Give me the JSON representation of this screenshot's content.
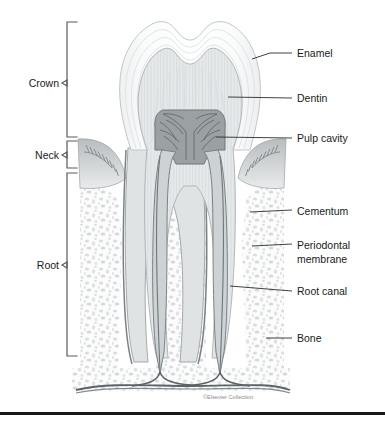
{
  "figure": {
    "background_color": "#ffffff",
    "credit": "©Elsevier Collection"
  },
  "region_labels": [
    {
      "id": "crown",
      "label": "Crown",
      "text_x": 60,
      "text_y": 85,
      "bracket_top": 22,
      "bracket_bottom": 137,
      "bracket_x": 67,
      "tick_x": 77
    },
    {
      "id": "neck",
      "label": "Neck",
      "text_x": 60,
      "text_y": 158,
      "bracket_top": 141,
      "bracket_bottom": 168,
      "bracket_x": 67,
      "tick_x": 77
    },
    {
      "id": "root",
      "label": "Root",
      "text_x": 60,
      "text_y": 267,
      "bracket_top": 173,
      "bracket_bottom": 356,
      "bracket_x": 67,
      "tick_x": 77
    }
  ],
  "part_labels": [
    {
      "id": "enamel",
      "label": "Enamel",
      "text_x": 298,
      "text_y": 55,
      "leader_from_x": 252,
      "leader_from_y": 58,
      "leader_to_x": 292,
      "leader_to_y": 52
    },
    {
      "id": "dentin",
      "label": "Dentin",
      "text_x": 298,
      "text_y": 101,
      "leader_from_x": 228,
      "leader_from_y": 97,
      "leader_to_x": 292,
      "leader_to_y": 98
    },
    {
      "id": "pulp-cavity",
      "label": "Pulp cavity",
      "text_x": 298,
      "text_y": 141,
      "leader_from_x": 218,
      "leader_from_y": 137,
      "leader_to_x": 292,
      "leader_to_y": 138
    },
    {
      "id": "cementum",
      "label": "Cementum",
      "text_x": 298,
      "text_y": 214,
      "leader_from_x": 252,
      "leader_from_y": 210,
      "leader_to_x": 292,
      "leader_to_y": 211
    },
    {
      "id": "periodontal-membrane",
      "label": "Periodontal",
      "label2": "membrane",
      "text_x": 298,
      "text_y": 248,
      "text2_y": 262,
      "leader_from_x": 256,
      "leader_from_y": 243,
      "leader_to_x": 292,
      "leader_to_y": 244
    },
    {
      "id": "root-canal",
      "label": "Root canal",
      "text_x": 298,
      "text_y": 294,
      "leader_from_x": 232,
      "leader_from_y": 286,
      "leader_to_x": 292,
      "leader_to_y": 291
    },
    {
      "id": "bone",
      "label": "Bone",
      "text_x": 298,
      "text_y": 341,
      "leader_from_x": 268,
      "leader_from_y": 338,
      "leader_to_x": 292,
      "leader_to_y": 338
    }
  ],
  "colors": {
    "enamel_fill": "#f7f8f8",
    "enamel_stroke": "#c9cdcf",
    "dentin_fill": "#e4e7e8",
    "dentin_stroke": "#b0b5b8",
    "pulp_fill": "#9ba0a3",
    "pulp_stroke": "#6e7477",
    "gum_fill": "#c5c9cb",
    "gum_stroke": "#8d9295",
    "bone_fill": "#fbfbfb",
    "bone_speckle": "#d8dcdd",
    "canal_stroke": "#8b9194",
    "nerve_stroke": "#6f7578",
    "label_text": "#1a1a1a",
    "leader_line": "#2b2b2b",
    "bracket_line": "#5a5a5a",
    "credit_text": "#8a8a8a",
    "bottom_bar": "#17181a"
  },
  "anatomy": {
    "parts": [
      "enamel",
      "dentin",
      "pulp cavity",
      "cementum",
      "periodontal membrane",
      "root canal",
      "bone",
      "gum"
    ],
    "regions": [
      "Crown",
      "Neck",
      "Root"
    ],
    "root_count": 2
  }
}
